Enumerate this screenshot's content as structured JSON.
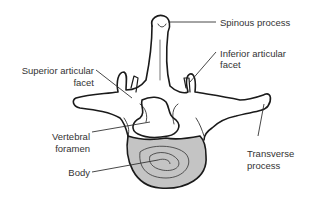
{
  "diagram": {
    "labels": {
      "spinous_process": "Spinous process",
      "inferior_articular_facet_1": "Inferior articular",
      "inferior_articular_facet_2": "facet",
      "superior_articular_facet_1": "Superior articular",
      "superior_articular_facet_2": "facet",
      "vertebral_foramen_1": "Vertebral",
      "vertebral_foramen_2": "foramen",
      "body": "Body",
      "transverse_process_1": "Transverse",
      "transverse_process_2": "process"
    },
    "colors": {
      "outline": "#1a1a1a",
      "body_fill": "#c4c4c4",
      "leader": "#333333",
      "text": "#333333"
    }
  }
}
